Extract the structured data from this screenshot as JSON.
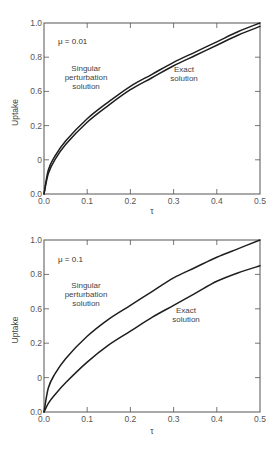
{
  "chart_data": [
    {
      "type": "line",
      "annotation": "μ = 0.01",
      "xlabel": "τ",
      "ylabel": "Uptake",
      "xlim": [
        0.0,
        0.5
      ],
      "ylim": [
        0.0,
        1.0
      ],
      "grid": false,
      "x_ticks": [
        "0.0",
        "0.1",
        "0.2",
        "0.3",
        "0.4",
        "0.5"
      ],
      "y_tick_labels": [
        "0.0",
        "0",
        "0.2",
        "0.6",
        "0.8",
        "1.0"
      ],
      "x": [
        0.0,
        0.01,
        0.025,
        0.05,
        0.1,
        0.15,
        0.2,
        0.25,
        0.3,
        0.35,
        0.4,
        0.45,
        0.5
      ],
      "series": [
        {
          "name": "Singular perturbation solution",
          "values": [
            0.0,
            0.14,
            0.22,
            0.31,
            0.44,
            0.54,
            0.63,
            0.7,
            0.77,
            0.83,
            0.89,
            0.95,
            1.0
          ]
        },
        {
          "name": "Exact solution",
          "values": [
            0.0,
            0.12,
            0.2,
            0.29,
            0.42,
            0.52,
            0.61,
            0.68,
            0.75,
            0.81,
            0.87,
            0.93,
            0.98
          ]
        }
      ],
      "labels": {
        "singular": [
          "Singular",
          "perturbation",
          "solution"
        ],
        "exact": [
          "Exact",
          "solution"
        ]
      }
    },
    {
      "type": "line",
      "annotation": "μ = 0.1",
      "xlabel": "τ",
      "ylabel": "Uptake",
      "xlim": [
        0.0,
        0.5
      ],
      "ylim": [
        0.0,
        1.0
      ],
      "grid": false,
      "x_ticks": [
        "0.0",
        "0.1",
        "0.2",
        "0.3",
        "0.4",
        "0.5"
      ],
      "y_tick_labels": [
        "0.0",
        "0",
        "0.2",
        "0.6",
        "0.8",
        "1.0"
      ],
      "x": [
        0.0,
        0.01,
        0.025,
        0.05,
        0.1,
        0.15,
        0.2,
        0.25,
        0.3,
        0.35,
        0.4,
        0.45,
        0.5
      ],
      "series": [
        {
          "name": "Singular perturbation solution",
          "values": [
            0.0,
            0.14,
            0.22,
            0.31,
            0.44,
            0.54,
            0.62,
            0.7,
            0.78,
            0.84,
            0.9,
            0.95,
            1.0
          ]
        },
        {
          "name": "Exact solution",
          "values": [
            0.0,
            0.05,
            0.1,
            0.17,
            0.29,
            0.39,
            0.47,
            0.55,
            0.62,
            0.69,
            0.76,
            0.81,
            0.85
          ]
        }
      ],
      "labels": {
        "singular": [
          "Singular",
          "perturbation",
          "solution"
        ],
        "exact": [
          "Exact",
          "solution"
        ]
      }
    }
  ]
}
